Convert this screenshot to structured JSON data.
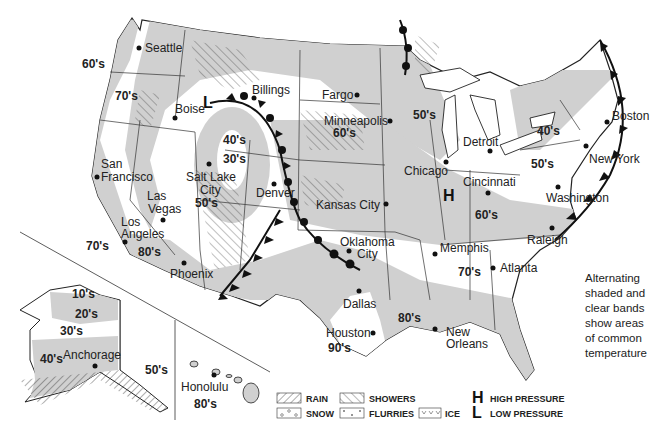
{
  "map": {
    "title": "U.S. Weather Map",
    "colors": {
      "shade": "#d0d0d0",
      "land_clear": "#ffffff",
      "border": "#222222",
      "front": "#111111"
    },
    "cities": [
      {
        "name": "Seattle",
        "x": 139,
        "y": 48
      },
      {
        "name": "Boise",
        "x": 175,
        "y": 118
      },
      {
        "name": "Billings",
        "x": 254,
        "y": 91
      },
      {
        "name": "Fargo",
        "x": 357,
        "y": 95
      },
      {
        "name": "Minneapolis",
        "x": 390,
        "y": 121
      },
      {
        "name": "San Francisco",
        "x": 97,
        "y": 177
      },
      {
        "name": "Salt Lake City",
        "x": 209,
        "y": 164
      },
      {
        "name": "Denver",
        "x": 274,
        "y": 184
      },
      {
        "name": "Las Vegas",
        "x": 163,
        "y": 220
      },
      {
        "name": "Los Angeles",
        "x": 125,
        "y": 242
      },
      {
        "name": "Phoenix",
        "x": 184,
        "y": 263
      },
      {
        "name": "Kansas City",
        "x": 386,
        "y": 204
      },
      {
        "name": "Oklahoma City",
        "x": 349,
        "y": 251
      },
      {
        "name": "Dallas",
        "x": 359,
        "y": 291
      },
      {
        "name": "Houston",
        "x": 373,
        "y": 333
      },
      {
        "name": "New Orleans",
        "x": 435,
        "y": 329
      },
      {
        "name": "Memphis",
        "x": 435,
        "y": 254
      },
      {
        "name": "Atlanta",
        "x": 493,
        "y": 268
      },
      {
        "name": "Raleigh",
        "x": 552,
        "y": 228
      },
      {
        "name": "Washington",
        "x": 558,
        "y": 190
      },
      {
        "name": "New York",
        "x": 587,
        "y": 146
      },
      {
        "name": "Boston",
        "x": 607,
        "y": 122
      },
      {
        "name": "Detroit",
        "x": 490,
        "y": 151
      },
      {
        "name": "Chicago",
        "x": 446,
        "y": 162
      },
      {
        "name": "Cincinnati",
        "x": 488,
        "y": 193
      },
      {
        "name": "Anchorage",
        "x": 95,
        "y": 366
      },
      {
        "name": "Honolulu",
        "x": 214,
        "y": 375
      }
    ],
    "temperature_labels": [
      {
        "label": "60's",
        "x": 82,
        "y": 68
      },
      {
        "label": "70's",
        "x": 115,
        "y": 100
      },
      {
        "label": "70's",
        "x": 86,
        "y": 250
      },
      {
        "label": "80's",
        "x": 138,
        "y": 256
      },
      {
        "label": "50's",
        "x": 195,
        "y": 207
      },
      {
        "label": "40's",
        "x": 223,
        "y": 144
      },
      {
        "label": "30's",
        "x": 223,
        "y": 163
      },
      {
        "label": "60's",
        "x": 333,
        "y": 137
      },
      {
        "label": "50's",
        "x": 413,
        "y": 119
      },
      {
        "label": "40's",
        "x": 537,
        "y": 135
      },
      {
        "label": "50's",
        "x": 531,
        "y": 168
      },
      {
        "label": "60's",
        "x": 475,
        "y": 219
      },
      {
        "label": "70's",
        "x": 458,
        "y": 276
      },
      {
        "label": "80's",
        "x": 398,
        "y": 322
      },
      {
        "label": "90's",
        "x": 328,
        "y": 352
      },
      {
        "label": "10's",
        "x": 72,
        "y": 298
      },
      {
        "label": "20's",
        "x": 75,
        "y": 318
      },
      {
        "label": "30's",
        "x": 60,
        "y": 335
      },
      {
        "label": "40's",
        "x": 40,
        "y": 363
      },
      {
        "label": "50's",
        "x": 145,
        "y": 374
      },
      {
        "label": "80's",
        "x": 194,
        "y": 408
      }
    ],
    "pressure_markers": [
      {
        "label": "H",
        "x": 449,
        "y": 197
      },
      {
        "label": "L",
        "x": 207,
        "y": 104
      }
    ]
  },
  "note": {
    "lines": [
      "Alternating",
      "shaded and",
      "clear bands",
      "show areas",
      "of common",
      "temperature"
    ]
  },
  "legend": {
    "items": [
      {
        "key": "rain",
        "label": "RAIN"
      },
      {
        "key": "showers",
        "label": "SHOWERS"
      },
      {
        "key": "snow",
        "label": "SNOW"
      },
      {
        "key": "flurries",
        "label": "FLURRIES"
      },
      {
        "key": "ice",
        "label": "ICE"
      }
    ],
    "pressure": [
      {
        "symbol": "H",
        "label": "HIGH PRESSURE"
      },
      {
        "symbol": "L",
        "label": "LOW PRESSURE"
      }
    ]
  }
}
